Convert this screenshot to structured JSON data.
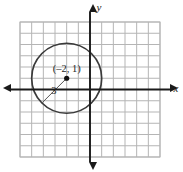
{
  "figure": {
    "width": 183,
    "height": 172,
    "background": "#ffffff"
  },
  "chart_data": {
    "type": "scatter",
    "title": "",
    "xlabel": "x",
    "ylabel": "y",
    "grid": true,
    "legend": false,
    "xlim": [
      -6,
      6
    ],
    "ylim": [
      -6,
      6
    ],
    "grid_step": 1,
    "shapes": [
      {
        "kind": "circle",
        "center": [
          -2,
          1
        ],
        "radius": 3,
        "center_label": "(–2, 1)",
        "radius_label": "3",
        "stroke": "#3a3a3a",
        "fill": "none"
      }
    ],
    "points": [
      {
        "x": -2,
        "y": 1,
        "label": "(–2, 1)",
        "marker": "filled-dot",
        "color": "#111111"
      }
    ],
    "annotations": [
      {
        "text": "(–2, 1)",
        "x": -2,
        "y": 1.6,
        "role": "center-coordinate"
      },
      {
        "text": "3",
        "x": -3.1,
        "y": -0.4,
        "role": "radius-length"
      }
    ]
  },
  "axes": {
    "x_label": "x",
    "y_label": "y",
    "x_axis_color": "#1a1a1a",
    "y_axis_color": "#1a1a1a",
    "arrow_directions": [
      "left",
      "right",
      "up",
      "down"
    ]
  },
  "grid": {
    "color": "#b5b5b5",
    "columns": 12,
    "rows": 12,
    "cell_size_px": 11.7
  },
  "colors": {
    "background": "#ffffff",
    "gridline": "#b5b5b5",
    "axis": "#1a1a1a",
    "circle_stroke": "#3a3a3a",
    "point_fill": "#111111",
    "text": "#1f1f1f"
  }
}
